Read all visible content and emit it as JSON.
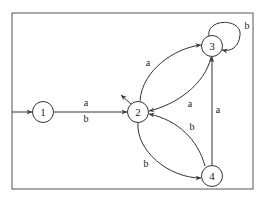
{
  "diagram": {
    "type": "finite-automaton",
    "frame": {
      "x": 12,
      "y": 13,
      "width": 241,
      "height": 176
    },
    "nodes": [
      {
        "id": "1",
        "label": "1",
        "cx": 43,
        "cy": 112
      },
      {
        "id": "2",
        "label": "2",
        "cx": 138,
        "cy": 112
      },
      {
        "id": "3",
        "label": "3",
        "cx": 212,
        "cy": 46
      },
      {
        "id": "4",
        "label": "4",
        "cx": 212,
        "cy": 176
      }
    ],
    "start_state": "1",
    "final_states": [
      "2"
    ],
    "edges": [
      {
        "from": "1",
        "to": "2",
        "label": "a\nb",
        "label_top": "a",
        "label_bottom": "b"
      },
      {
        "from": "2",
        "to": "3",
        "label": "a"
      },
      {
        "from": "3",
        "to": "2",
        "label": "a"
      },
      {
        "from": "3",
        "to": "3",
        "label": "b"
      },
      {
        "from": "2",
        "to": "4",
        "label": "b"
      },
      {
        "from": "4",
        "to": "2",
        "label": "b"
      },
      {
        "from": "4",
        "to": "3",
        "label": "a"
      }
    ],
    "colors": {
      "stroke": "#333333",
      "background": "#ffffff"
    }
  }
}
